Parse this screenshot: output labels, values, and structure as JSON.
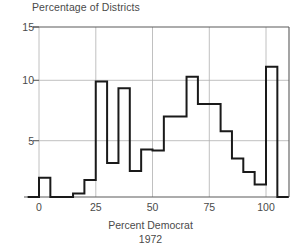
{
  "chart_data": {
    "type": "bar",
    "title": "Percentage of Districts",
    "xlabel": "Percent Democrat",
    "xlabel_sub": "1972",
    "ylabel": "",
    "style": "histogram-step-outline",
    "grid": true,
    "legend": "none",
    "xlim": [
      -5,
      110
    ],
    "ylim": [
      0,
      15
    ],
    "xticks": [
      0,
      25,
      50,
      75,
      100
    ],
    "yticks": [
      0,
      5,
      10,
      15
    ],
    "xtick_labels": [
      "0",
      "25",
      "50",
      "75",
      "100"
    ],
    "ytick_labels": [
      "5",
      "10",
      "15"
    ],
    "bin_width": 5,
    "bin_edges": [
      -5,
      0,
      5,
      10,
      15,
      20,
      25,
      30,
      35,
      40,
      45,
      50,
      55,
      60,
      65,
      70,
      75,
      80,
      85,
      90,
      95,
      100,
      105,
      110
    ],
    "categories": [
      "-5 to 0",
      "0 to 5",
      "5 to 10",
      "10 to 15",
      "15 to 20",
      "20 to 25",
      "25 to 30",
      "30 to 35",
      "35 to 40",
      "40 to 45",
      "45 to 50",
      "50 to 55",
      "55 to 60",
      "60 to 65",
      "65 to 70",
      "70 to 75",
      "75 to 80",
      "80 to 85",
      "85 to 90",
      "90 to 95",
      "95 to 100",
      "100 to 105",
      "105 to 110"
    ],
    "values": [
      0,
      1.7,
      0,
      0,
      0.3,
      1.5,
      10.2,
      3.0,
      9.6,
      2.3,
      4.2,
      4.1,
      7.1,
      7.1,
      10.6,
      8.2,
      8.2,
      5.8,
      3.4,
      2.2,
      1.1,
      11.5,
      0
    ],
    "line_color": "#1a1a1a",
    "grid_color": "#b0b0b0",
    "axis_color": "#5a5a5a",
    "background": "#ffffff"
  },
  "geometry": {
    "plot_left": 39,
    "plot_right": 289,
    "plot_top": 27,
    "plot_bottom": 197,
    "x0_px": 39,
    "x100_px": 266,
    "y0_px": 197,
    "y15_px": 27
  }
}
